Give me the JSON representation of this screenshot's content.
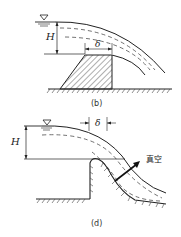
{
  "diagrams": [
    {
      "id": "b",
      "caption": "(b)",
      "labels": {
        "head": "H",
        "crest_width": "δ"
      },
      "water_surface_symbol": "▽"
    },
    {
      "id": "d",
      "caption": "(d)",
      "labels": {
        "head": "H",
        "crest_width": "δ",
        "vacuum": "真空"
      },
      "water_surface_symbol": "▽"
    }
  ],
  "colors": {
    "line": "#222222",
    "background": "#ffffff"
  }
}
